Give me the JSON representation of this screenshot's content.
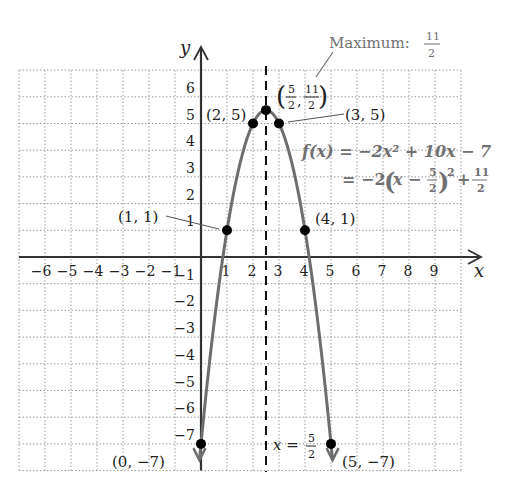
{
  "chart_data": {
    "type": "line",
    "title": "",
    "xlabel": "x",
    "ylabel": "y",
    "xlim": [
      -7,
      10
    ],
    "ylim": [
      -8,
      7
    ],
    "grid": true,
    "x_ticks": [
      -6,
      -5,
      -4,
      -3,
      -2,
      -1,
      1,
      2,
      3,
      4,
      5,
      6,
      7,
      8,
      9
    ],
    "y_ticks": [
      6,
      5,
      4,
      3,
      2,
      1,
      -1,
      -2,
      -3,
      -4,
      -5,
      -6,
      -7
    ],
    "function": {
      "expanded": "f(x) = −2x² + 10x − 7",
      "vertex_form": "= −2(x − 5/2)² + 11/2",
      "a": -2,
      "b": 10,
      "c": -7
    },
    "axis_of_symmetry": {
      "label": "x = 5/2",
      "x": 2.5
    },
    "maximum": {
      "label": "Maximum: 11/2",
      "value": 5.5
    },
    "points": [
      {
        "x": 0,
        "y": -7,
        "label": "(0, −7)"
      },
      {
        "x": 1,
        "y": 1,
        "label": "(1, 1)"
      },
      {
        "x": 2,
        "y": 5,
        "label": "(2, 5)"
      },
      {
        "x": 2.5,
        "y": 5.5,
        "label": "(5/2, 11/2)"
      },
      {
        "x": 3,
        "y": 5,
        "label": "(3, 5)"
      },
      {
        "x": 4,
        "y": 1,
        "label": "(4, 1)"
      },
      {
        "x": 5,
        "y": -7,
        "label": "(5, −7)"
      }
    ],
    "colors": {
      "curve": "#6e6e6e",
      "axis": "#333333",
      "grid": "#9a9a9a",
      "annotation": "#707070"
    }
  },
  "labels": {
    "x_axis": "x",
    "y_axis": "y",
    "maximum_text": "Maximum:",
    "maximum_num": "11",
    "maximum_den": "2",
    "eq1": "f(x) = −2x² + 10x − 7",
    "eq2_prefix": "= −2",
    "pt_0_m7": "(0, −7)",
    "pt_1_1": "(1, 1)",
    "pt_2_5": "(2, 5)",
    "pt_3_5": "(3, 5)",
    "pt_4_1": "(4, 1)",
    "pt_5_m7": "(5, −7)",
    "axis_sym_x": "x =",
    "frac_5": "5",
    "frac_2": "2",
    "frac_11": "11"
  }
}
